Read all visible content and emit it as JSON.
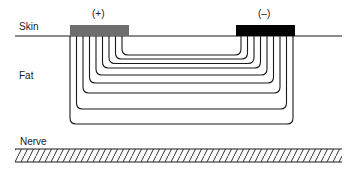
{
  "diagram": {
    "layers": {
      "skin": "Skin",
      "fat": "Fat",
      "nerve": "Nerve"
    },
    "electrodes": {
      "anode": {
        "label": "(+)",
        "color": "#6e6e6e"
      },
      "cathode": {
        "label": "(–)",
        "color": "#000000"
      }
    },
    "current_paths": {
      "count": 9,
      "left_x": [
        70,
        76.5,
        83,
        89.5,
        96,
        102.5,
        109,
        115.5,
        122
      ],
      "right_x": [
        293,
        286.5,
        280,
        273.5,
        267,
        260.5,
        254,
        247.5,
        241
      ],
      "bottom_y": [
        124,
        109,
        93,
        83,
        75,
        68,
        63.5,
        59,
        55
      ]
    },
    "colors": {
      "line": "#1a1a1a",
      "hatch": "#333333"
    }
  }
}
